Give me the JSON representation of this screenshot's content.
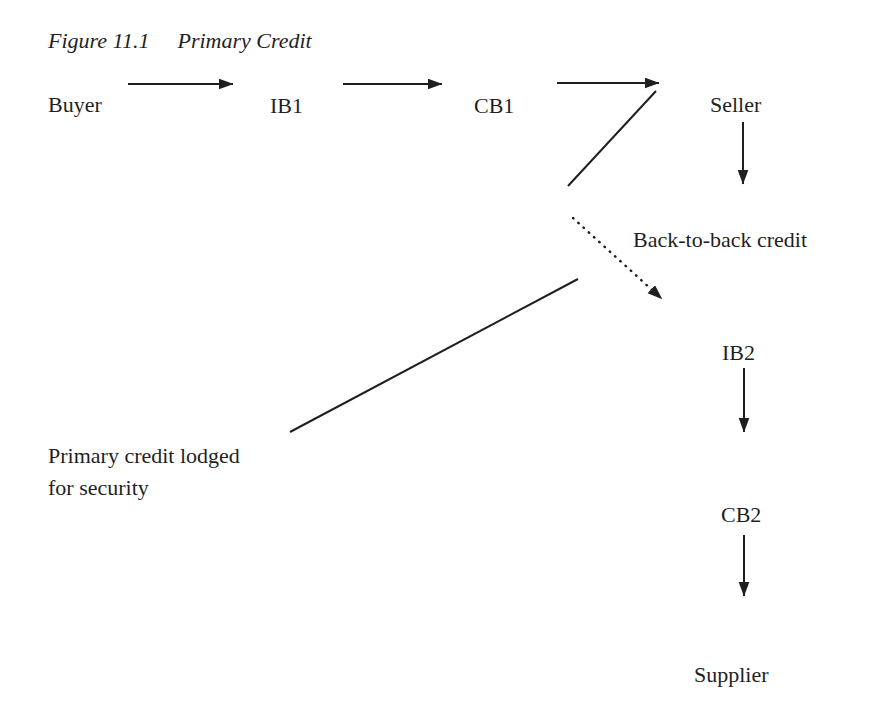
{
  "page": {
    "background": "#ffffff",
    "ink": "#1f1f1f"
  },
  "figure": {
    "label": "Figure 11.1",
    "title": "Primary Credit"
  },
  "nodes": {
    "buyer": "Buyer",
    "ib1": "IB1",
    "cb1": "CB1",
    "seller": "Seller",
    "ib2": "IB2",
    "cb2": "CB2",
    "supplier": "Supplier"
  },
  "annotations": {
    "back_to_back": "Back-to-back credit",
    "primary_lodged_line1": "Primary credit lodged",
    "primary_lodged_line2": "for security"
  },
  "edges": [
    {
      "from": "Buyer",
      "to": "IB1",
      "style": "solid-arrow"
    },
    {
      "from": "IB1",
      "to": "CB1",
      "style": "solid-arrow"
    },
    {
      "from": "CB1",
      "to": "Seller",
      "style": "solid-arrow"
    },
    {
      "from": "Seller",
      "to": "Back-to-back credit",
      "style": "solid-arrow-down"
    },
    {
      "from": "Back-to-back credit",
      "to": "IB2",
      "style": "dotted-arrow"
    },
    {
      "from": "Primary credit lodged for security",
      "to": "CB1-Seller arrowhead",
      "style": "solid-line"
    },
    {
      "from": "IB2",
      "to": "CB2",
      "style": "solid-arrow-down"
    },
    {
      "from": "CB2",
      "to": "Supplier",
      "style": "solid-arrow-down"
    }
  ]
}
